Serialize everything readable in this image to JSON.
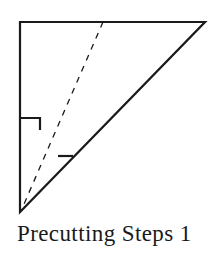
{
  "diagram": {
    "caption": "Precutting Steps 1",
    "stroke_color": "#1a1a1a",
    "triangle": {
      "top_left": [
        20,
        22
      ],
      "top_right": [
        205,
        22
      ],
      "bottom": [
        20,
        212
      ]
    },
    "fold_line": {
      "from": [
        103,
        22
      ],
      "to": [
        21,
        211
      ],
      "style": "dashed"
    },
    "right_angle_markers": [
      {
        "points": [
          [
            20,
            118
          ],
          [
            40,
            118
          ],
          [
            40,
            130
          ]
        ]
      },
      {
        "points": [
          [
            58,
            156
          ],
          [
            72,
            156
          ]
        ]
      }
    ]
  }
}
